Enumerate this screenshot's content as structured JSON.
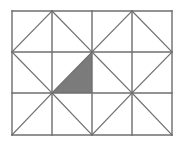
{
  "diagram": {
    "type": "grid-with-diagonals",
    "columns": 4,
    "rows": 3,
    "x_lines": [
      12,
      52,
      92,
      132,
      172
    ],
    "y_lines": [
      11,
      52,
      93,
      135
    ],
    "line_color": "#6e6e6e",
    "fill_color": "#7b7b7b",
    "background": "#ffffff",
    "diagonals": [
      {
        "cell": [
          0,
          0
        ],
        "from": [
          12,
          52
        ],
        "to": [
          52,
          11
        ]
      },
      {
        "cell": [
          1,
          0
        ],
        "from": [
          52,
          11
        ],
        "to": [
          92,
          52
        ]
      },
      {
        "cell": [
          2,
          0
        ],
        "from": [
          92,
          52
        ],
        "to": [
          132,
          11
        ]
      },
      {
        "cell": [
          3,
          0
        ],
        "from": [
          132,
          11
        ],
        "to": [
          172,
          52
        ]
      },
      {
        "cell": [
          0,
          1
        ],
        "from": [
          12,
          52
        ],
        "to": [
          52,
          93
        ]
      },
      {
        "cell": [
          1,
          1
        ],
        "from": [
          52,
          93
        ],
        "to": [
          92,
          52
        ]
      },
      {
        "cell": [
          2,
          1
        ],
        "from": [
          92,
          52
        ],
        "to": [
          132,
          93
        ]
      },
      {
        "cell": [
          3,
          1
        ],
        "from": [
          132,
          93
        ],
        "to": [
          172,
          52
        ]
      },
      {
        "cell": [
          0,
          2
        ],
        "from": [
          12,
          135
        ],
        "to": [
          52,
          93
        ]
      },
      {
        "cell": [
          1,
          2
        ],
        "from": [
          52,
          93
        ],
        "to": [
          92,
          135
        ]
      },
      {
        "cell": [
          2,
          2
        ],
        "from": [
          92,
          135
        ],
        "to": [
          132,
          93
        ]
      },
      {
        "cell": [
          3,
          2
        ],
        "from": [
          132,
          93
        ],
        "to": [
          172,
          135
        ]
      }
    ],
    "shaded_triangle": {
      "points": [
        [
          52,
          93
        ],
        [
          92,
          52
        ],
        [
          92,
          93
        ]
      ]
    }
  }
}
